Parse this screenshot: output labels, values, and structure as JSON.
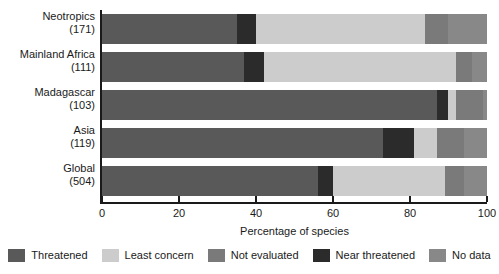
{
  "chart_data": {
    "type": "bar",
    "orientation": "horizontal",
    "stacked": true,
    "normalized_percent": true,
    "title": "",
    "xlabel": "Percentage of species",
    "ylabel": "",
    "xlim": [
      0,
      100
    ],
    "xticks": [
      0,
      20,
      40,
      60,
      80,
      100
    ],
    "xtick_labels": [
      "0",
      "20",
      "40",
      "60",
      "80",
      "100"
    ],
    "grid": false,
    "legend_position": "bottom",
    "categories": [
      "Neotropics",
      "Mainland Africa",
      "Madagascar",
      "Asia",
      "Global"
    ],
    "category_counts": [
      "(171)",
      "(111)",
      "(103)",
      "(119)",
      "(504)"
    ],
    "series": [
      {
        "name": "Threatened",
        "color": "#595959",
        "values": [
          35,
          37,
          87,
          73,
          56
        ]
      },
      {
        "name": "Least concern",
        "color": "#cccccc",
        "values": [
          44,
          50,
          2,
          6,
          29
        ]
      },
      {
        "name": "Not evaluated",
        "color": "#7a7a7a",
        "values": [
          6,
          4,
          7,
          7,
          5
        ]
      },
      {
        "name": "Near threatened",
        "color": "#2b2b2b",
        "values": [
          5,
          5,
          3,
          8,
          4
        ]
      },
      {
        "name": "No data",
        "color": "#888888",
        "values": [
          10,
          4,
          1,
          6,
          6
        ]
      }
    ],
    "stack_order": [
      "Threatened",
      "Near threatened",
      "Least concern",
      "Not evaluated",
      "No data"
    ],
    "rows": [
      {
        "label": "Neotropics",
        "count": "(171)",
        "segments": [
          {
            "key": "Threatened",
            "start": 0,
            "end": 35,
            "value": 35
          },
          {
            "key": "Near threatened",
            "start": 35,
            "end": 40,
            "value": 5
          },
          {
            "key": "Least concern",
            "start": 40,
            "end": 84,
            "value": 44
          },
          {
            "key": "Not evaluated",
            "start": 84,
            "end": 90,
            "value": 6
          },
          {
            "key": "No data",
            "start": 90,
            "end": 100,
            "value": 10
          }
        ]
      },
      {
        "label": "Mainland Africa",
        "count": "(111)",
        "segments": [
          {
            "key": "Threatened",
            "start": 0,
            "end": 37,
            "value": 37
          },
          {
            "key": "Near threatened",
            "start": 37,
            "end": 42,
            "value": 5
          },
          {
            "key": "Least concern",
            "start": 42,
            "end": 92,
            "value": 50
          },
          {
            "key": "Not evaluated",
            "start": 92,
            "end": 96,
            "value": 4
          },
          {
            "key": "No data",
            "start": 96,
            "end": 100,
            "value": 4
          }
        ]
      },
      {
        "label": "Madagascar",
        "count": "(103)",
        "segments": [
          {
            "key": "Threatened",
            "start": 0,
            "end": 87,
            "value": 87
          },
          {
            "key": "Near threatened",
            "start": 87,
            "end": 90,
            "value": 3
          },
          {
            "key": "Least concern",
            "start": 90,
            "end": 92,
            "value": 2
          },
          {
            "key": "Not evaluated",
            "start": 92,
            "end": 99,
            "value": 7
          },
          {
            "key": "No data",
            "start": 99,
            "end": 100,
            "value": 1
          }
        ]
      },
      {
        "label": "Asia",
        "count": "(119)",
        "segments": [
          {
            "key": "Threatened",
            "start": 0,
            "end": 73,
            "value": 73
          },
          {
            "key": "Near threatened",
            "start": 73,
            "end": 81,
            "value": 8
          },
          {
            "key": "Least concern",
            "start": 81,
            "end": 87,
            "value": 6
          },
          {
            "key": "Not evaluated",
            "start": 87,
            "end": 94,
            "value": 7
          },
          {
            "key": "No data",
            "start": 94,
            "end": 100,
            "value": 6
          }
        ]
      },
      {
        "label": "Global",
        "count": "(504)",
        "segments": [
          {
            "key": "Threatened",
            "start": 0,
            "end": 56,
            "value": 56
          },
          {
            "key": "Near threatened",
            "start": 56,
            "end": 60,
            "value": 4
          },
          {
            "key": "Least concern",
            "start": 60,
            "end": 89,
            "value": 29
          },
          {
            "key": "Not evaluated",
            "start": 89,
            "end": 94,
            "value": 5
          },
          {
            "key": "No data",
            "start": 94,
            "end": 100,
            "value": 6
          }
        ]
      }
    ],
    "legend": [
      {
        "label": "Threatened",
        "color": "#595959"
      },
      {
        "label": "Least concern",
        "color": "#cccccc"
      },
      {
        "label": "Not evaluated",
        "color": "#7a7a7a"
      },
      {
        "label": "Near threatened",
        "color": "#2b2b2b"
      },
      {
        "label": "No data",
        "color": "#888888"
      }
    ]
  },
  "colors": {
    "threatened": "#595959",
    "least_concern": "#cccccc",
    "not_evaluated": "#7a7a7a",
    "near_threatened": "#2b2b2b",
    "no_data": "#888888",
    "axis": "#1a1a1a",
    "background": "#ffffff"
  }
}
